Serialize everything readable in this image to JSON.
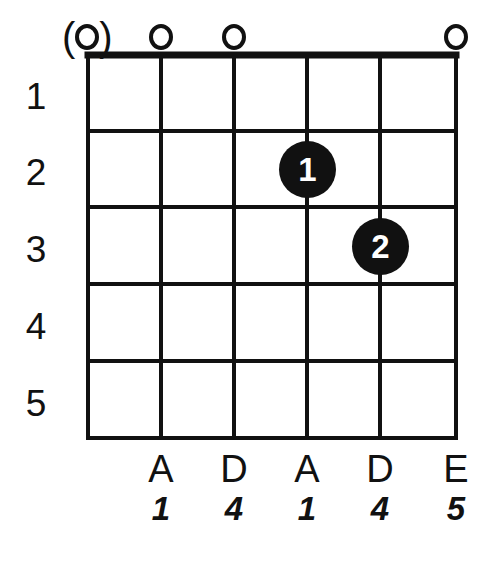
{
  "diagram": {
    "type": "guitar-chord-diagram",
    "line_color": "#111111",
    "dot_color": "#111111",
    "dot_text_color": "#ffffff",
    "background_color": "#ffffff",
    "string_count": 6,
    "fret_count": 5,
    "geometry": {
      "string_x": [
        88,
        161,
        234,
        307,
        380,
        456
      ],
      "fret_y": [
        55,
        131,
        207,
        284,
        361,
        438
      ]
    },
    "fret_numbers": [
      {
        "label": "1",
        "y": 78
      },
      {
        "label": "2",
        "y": 154
      },
      {
        "label": "3",
        "y": 231
      },
      {
        "label": "4",
        "y": 308
      },
      {
        "label": "5",
        "y": 385
      }
    ],
    "open_markers": [
      {
        "string": 1,
        "symbol": "(o)",
        "optional": true,
        "x": 88
      },
      {
        "string": 2,
        "symbol": "o",
        "optional": false,
        "x": 161
      },
      {
        "string": 3,
        "symbol": "o",
        "optional": false,
        "x": 234
      },
      {
        "string": 6,
        "symbol": "o",
        "optional": false,
        "x": 456
      }
    ],
    "finger_dots": [
      {
        "label": "1",
        "string": 4,
        "fret": 2,
        "x": 307,
        "y": 169
      },
      {
        "label": "2",
        "string": 5,
        "fret": 3,
        "x": 380,
        "y": 246
      }
    ],
    "bottom_labels": [
      {
        "note": "A",
        "degree": "1",
        "x": 161
      },
      {
        "note": "D",
        "degree": "4",
        "x": 234
      },
      {
        "note": "A",
        "degree": "1",
        "x": 307
      },
      {
        "note": "D",
        "degree": "4",
        "x": 380
      },
      {
        "note": "E",
        "degree": "5",
        "x": 456
      }
    ],
    "note_label_y": 450,
    "degree_label_y": 492
  }
}
